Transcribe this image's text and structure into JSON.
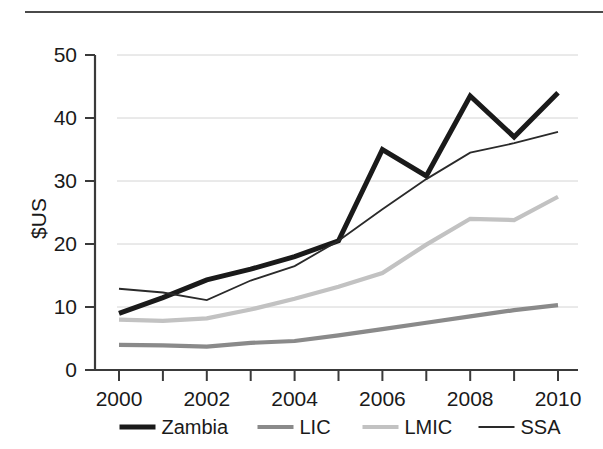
{
  "figure": {
    "top_rule": "horizontal-rule"
  },
  "chart_data": {
    "type": "line",
    "title": "",
    "subtitle": "",
    "xlabel": "",
    "ylabel": "$US",
    "x": [
      2000,
      2001,
      2002,
      2003,
      2004,
      2005,
      2006,
      2007,
      2008,
      2009,
      2010
    ],
    "xtick_labels": [
      "2000",
      "2002",
      "2004",
      "2006",
      "2008",
      "2010"
    ],
    "xtick_values": [
      2000,
      2002,
      2004,
      2006,
      2008,
      2010
    ],
    "xminor_ticks": [
      2000,
      2001,
      2002,
      2003,
      2004,
      2005,
      2006,
      2007,
      2008,
      2009,
      2010
    ],
    "xlim": [
      2000,
      2010
    ],
    "ytick_labels": [
      "0",
      "10",
      "20",
      "30",
      "40",
      "50"
    ],
    "ytick_values": [
      0,
      10,
      20,
      30,
      40,
      50
    ],
    "ylim": [
      0,
      50
    ],
    "grid": "horizontal",
    "legend_position": "bottom",
    "series": [
      {
        "name": "Zambia",
        "color": "#1a1a1a",
        "width": 5.0,
        "values": [
          9.0,
          11.5,
          14.3,
          16.0,
          18.0,
          20.5,
          35.0,
          30.8,
          43.5,
          37.0,
          44.0
        ]
      },
      {
        "name": "LIC",
        "color": "#8a8a8a",
        "width": 4.2,
        "values": [
          4.0,
          3.9,
          3.7,
          4.3,
          4.6,
          5.5,
          6.5,
          7.5,
          8.5,
          9.5,
          10.3
        ]
      },
      {
        "name": "LMIC",
        "color": "#c2c2c2",
        "width": 4.2,
        "values": [
          8.0,
          7.8,
          8.2,
          9.6,
          11.3,
          13.2,
          15.4,
          19.9,
          24.0,
          23.8,
          27.5
        ]
      },
      {
        "name": "SSA",
        "color": "#2a2a2a",
        "width": 1.8,
        "values": [
          12.9,
          12.3,
          11.1,
          14.2,
          16.5,
          20.5,
          25.5,
          30.3,
          34.5,
          36.0,
          37.8
        ]
      }
    ]
  },
  "legend": {
    "items": [
      {
        "label": "Zambia",
        "color": "#1a1a1a",
        "width": 5.0
      },
      {
        "label": "LIC",
        "color": "#8a8a8a",
        "width": 4.2
      },
      {
        "label": "LMIC",
        "color": "#c2c2c2",
        "width": 4.2
      },
      {
        "label": "SSA",
        "color": "#2a2a2a",
        "width": 1.8
      }
    ]
  }
}
